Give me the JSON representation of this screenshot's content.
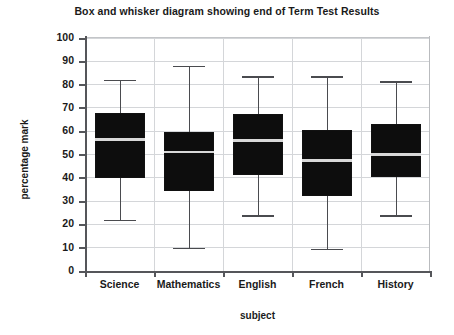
{
  "chart_data": {
    "type": "box",
    "title": "Box and whisker diagram showing end of Term Test Results",
    "xlabel": "subject",
    "ylabel": "percentage  mark",
    "categories": [
      "Science",
      "Mathematics",
      "English",
      "French",
      "History"
    ],
    "ylim": [
      0,
      100
    ],
    "ytick_labels": [
      "0",
      "10",
      "20",
      "30",
      "40",
      "50",
      "60",
      "70",
      "80",
      "90",
      "100"
    ],
    "ytick_values": [
      0,
      10,
      20,
      30,
      40,
      50,
      60,
      70,
      80,
      90,
      100
    ],
    "grid": "horizontal-and-vertical",
    "legend": "none",
    "boxes": [
      {
        "category": "Science",
        "min": 22,
        "q1": 40,
        "median": 56.5,
        "q3": 68,
        "max": 82
      },
      {
        "category": "Mathematics",
        "min": 10,
        "q1": 34.5,
        "median": 51,
        "q3": 59.5,
        "max": 88
      },
      {
        "category": "English",
        "min": 24,
        "q1": 41,
        "median": 56,
        "q3": 67.5,
        "max": 83.5
      },
      {
        "category": "French",
        "min": 9.5,
        "q1": 32,
        "median": 47.5,
        "q3": 60.5,
        "max": 83.5
      },
      {
        "category": "History",
        "min": 24,
        "q1": 40.5,
        "median": 50,
        "q3": 63,
        "max": 81.5
      }
    ],
    "colors": {
      "box_fill": "#0d0d0d",
      "median_line": "#d8d8d8",
      "whisker": "#4a4b4f",
      "grid": "#d4d6d9",
      "axis": "#55565a",
      "text": "#1a1a1a",
      "background": "#ffffff"
    }
  }
}
